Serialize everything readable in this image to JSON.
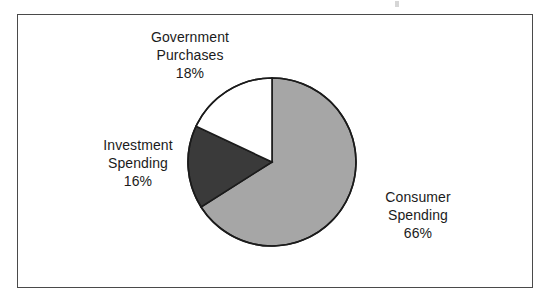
{
  "figure": {
    "background_color": "#ffffff",
    "frame_color": "#4a4a4a",
    "text_color": "#1b1b1b"
  },
  "chart_data": {
    "type": "pie",
    "title": "",
    "subtitle": "",
    "xlabel": "",
    "ylabel": "",
    "legend_position": "none",
    "grid": false,
    "start_angle_deg": 0,
    "direction": "clockwise",
    "units": "percent",
    "total": 100,
    "categories": [
      "Consumer Spending",
      "Investment Spending",
      "Government Purchases"
    ],
    "values": [
      66,
      16,
      18
    ],
    "colors": [
      "#a6a6a6",
      "#3a3a3a",
      "#ffffff"
    ],
    "outline_color": "#1b1b1b",
    "slices": [
      {
        "name": "Consumer Spending",
        "label_line1": "Consumer",
        "label_line2": "Spending",
        "value": 66,
        "value_label": "66%",
        "color": "#a6a6a6",
        "start_deg": 0,
        "end_deg": 237.6
      },
      {
        "name": "Investment Spending",
        "label_line1": "Investment",
        "label_line2": "Spending",
        "value": 16,
        "value_label": "16%",
        "color": "#3a3a3a",
        "start_deg": 237.6,
        "end_deg": 295.2
      },
      {
        "name": "Government Purchases",
        "label_line1": "Government",
        "label_line2": "Purchases",
        "value": 18,
        "value_label": "18%",
        "color": "#ffffff",
        "start_deg": 295.2,
        "end_deg": 360
      }
    ]
  },
  "geometry": {
    "center_x": 272,
    "center_y": 162,
    "radius": 84
  }
}
